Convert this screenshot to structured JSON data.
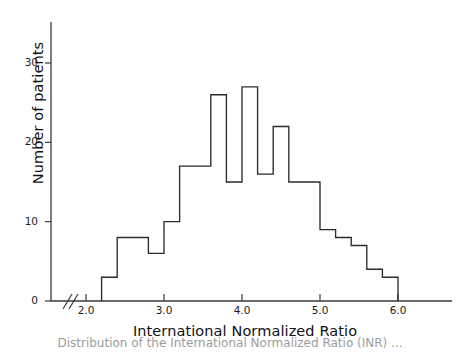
{
  "chart_data": {
    "type": "bar",
    "title": "",
    "subtitle": "",
    "xlabel": "International Normalized Ratio",
    "ylabel": "Number of patients",
    "xlim": [
      1.85,
      6.35
    ],
    "ylim": [
      0,
      35
    ],
    "grid": false,
    "legend": null,
    "axis_break_x": true,
    "bin_width": 0.2,
    "xticks": [
      2.0,
      3.0,
      4.0,
      5.0,
      6.0
    ],
    "xtick_labels": [
      "2.0",
      "3.0",
      "4.0",
      "5.0",
      "6.0"
    ],
    "yticks": [
      0,
      10,
      20,
      30
    ],
    "ytick_labels": [
      "0",
      "10",
      "20",
      "30"
    ],
    "bin_edges": [
      2.2,
      2.4,
      2.6,
      2.8,
      3.0,
      3.2,
      3.4,
      3.6,
      3.8,
      4.0,
      4.2,
      4.4,
      4.6,
      4.8,
      5.0,
      5.2,
      5.4,
      5.6,
      5.8,
      6.0
    ],
    "categories": [
      "2.2-2.4",
      "2.4-2.6",
      "2.6-2.8",
      "2.8-3.0",
      "3.0-3.2",
      "3.2-3.4",
      "3.4-3.6",
      "3.6-3.8",
      "3.8-4.0",
      "4.0-4.2",
      "4.2-4.4",
      "4.4-4.6",
      "4.6-4.8",
      "4.8-5.0",
      "5.0-5.2",
      "5.2-5.4",
      "5.4-5.6",
      "5.6-5.8",
      "5.8-6.0"
    ],
    "values": [
      3,
      8,
      8,
      6,
      10,
      17,
      17,
      26,
      15,
      27,
      16,
      22,
      15,
      15,
      9,
      8,
      7,
      4,
      3
    ],
    "total_patients": 238,
    "line_color": "#2b2b2b",
    "fill_color": "none",
    "axis_color": "#3a3a3a"
  },
  "caption": "Distribution of the International Normalized Ratio (INR) ..."
}
